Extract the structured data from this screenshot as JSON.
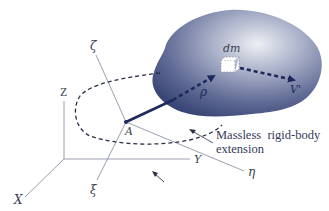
{
  "figure": {
    "inertial_axes": {
      "x": "X",
      "y": "Y",
      "z": "Z"
    },
    "body_axes": {
      "xi": "ξ",
      "eta": "η",
      "zeta": "ζ"
    },
    "origin_label": "A",
    "mass_element_label": "dm",
    "position_vector_label": "ρ",
    "velocity_label": "V'",
    "annotation": {
      "line1": "Massless  rigid-body",
      "line2": "extension"
    },
    "colors": {
      "body_dark": "#3d4a78",
      "body_light": "#dfe3ee",
      "vector": "#1f2a5c",
      "axis_line": "#8e93a8",
      "text": "#3a3f52"
    }
  }
}
